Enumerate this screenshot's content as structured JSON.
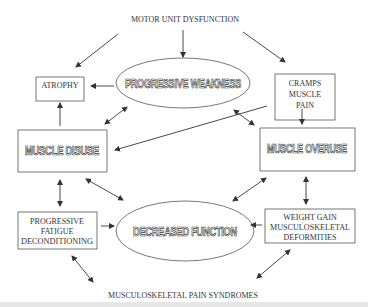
{
  "diagram": {
    "top_label": "MOTOR UNIT DYSFUNCTION",
    "bottom_label": "MUSCULOSKELETAL PAIN SYNDROMES",
    "nodes": {
      "atrophy": {
        "lines": [
          "ATROPHY"
        ]
      },
      "progressive_weakness": {
        "label": "PROGRESSIVE WEAKNESS"
      },
      "cramps": {
        "lines": [
          "CRAMPS",
          "MUSCLE",
          "PAIN"
        ]
      },
      "muscle_disuse": {
        "label": "MUSCLE DISUSE"
      },
      "muscle_overuse": {
        "label": "MUSCLE OVERUSE"
      },
      "fatigue": {
        "lines": [
          "PROGRESSIVE",
          "FATIGUE",
          "DECONDITIONING"
        ]
      },
      "decreased_function": {
        "label": "DECREASED FUNCTION"
      },
      "weight_gain": {
        "lines": [
          "WEIGHT GAIN",
          "MUSCULOSKELETAL",
          "DEFORMITIES"
        ]
      }
    },
    "colors": {
      "stroke": "#333333",
      "background": "#ffffff",
      "strip": "#e6e6e6"
    }
  }
}
